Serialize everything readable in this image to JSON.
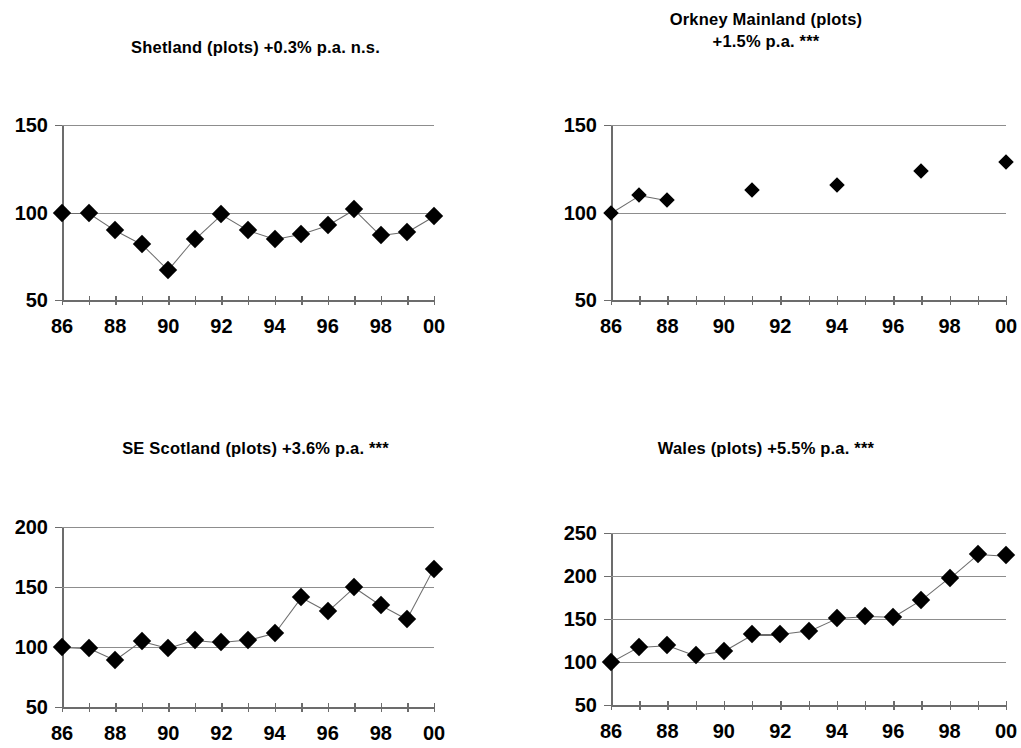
{
  "figure": {
    "panels": [
      {
        "id": "shetland",
        "title_lines": [
          "Shetland (plots) +0.3% p.a. n.s."
        ],
        "ylabels": [
          "150",
          "100",
          "50"
        ],
        "xlabels": [
          "86",
          "88",
          "90",
          "92",
          "94",
          "96",
          "98",
          "00"
        ],
        "marker_color": "#000000",
        "line_color": "#6b6b6b"
      },
      {
        "id": "orkney",
        "title_lines": [
          "Orkney Mainland (plots)",
          "+1.5% p.a. ***"
        ],
        "ylabels": [
          "150",
          "100",
          "50"
        ],
        "xlabels": [
          "86",
          "88",
          "90",
          "92",
          "94",
          "96",
          "98",
          "00"
        ],
        "marker_color": "#000000",
        "line_color": "#6b6b6b"
      },
      {
        "id": "se_scotland",
        "title_lines": [
          "SE Scotland (plots) +3.6% p.a. ***"
        ],
        "ylabels": [
          "200",
          "150",
          "100",
          "50"
        ],
        "xlabels": [
          "86",
          "88",
          "90",
          "92",
          "94",
          "96",
          "98",
          "00"
        ],
        "marker_color": "#000000",
        "line_color": "#6b6b6b"
      },
      {
        "id": "wales",
        "title_lines": [
          "Wales (plots) +5.5% p.a. ***"
        ],
        "ylabels": [
          "250",
          "200",
          "150",
          "100",
          "50"
        ],
        "xlabels": [
          "86",
          "88",
          "90",
          "92",
          "94",
          "96",
          "98",
          "00"
        ],
        "marker_color": "#000000",
        "line_color": "#6b6b6b"
      }
    ]
  },
  "chart_data": [
    {
      "type": "line",
      "title": "Shetland (plots) +0.3% p.a. n.s.",
      "xlabel": "",
      "ylabel": "",
      "x": [
        86,
        87,
        88,
        89,
        90,
        91,
        92,
        93,
        94,
        95,
        96,
        97,
        98,
        99,
        0
      ],
      "tick_labels": [
        "86",
        "87",
        "88",
        "89",
        "90",
        "91",
        "92",
        "93",
        "94",
        "95",
        "96",
        "97",
        "98",
        "99",
        "00"
      ],
      "xtick_labels_shown": [
        "86",
        "88",
        "90",
        "92",
        "94",
        "96",
        "98",
        "00"
      ],
      "values": [
        100,
        100,
        90,
        82,
        67,
        85,
        99,
        90,
        85,
        88,
        93,
        102,
        87,
        89,
        98
      ],
      "ylim": [
        50,
        150
      ],
      "yticks": [
        50,
        100,
        150
      ],
      "grid": true,
      "legend": "none",
      "annotation": "+0.3% p.a. n.s."
    },
    {
      "type": "scatter",
      "title": "Orkney Mainland (plots) +1.5% p.a. ***",
      "xlabel": "",
      "ylabel": "",
      "x": [
        86,
        87,
        88,
        91,
        94,
        97,
        0
      ],
      "tick_labels": [
        "86",
        "87",
        "88",
        "91",
        "94",
        "97",
        "00"
      ],
      "xtick_labels_shown": [
        "86",
        "88",
        "90",
        "92",
        "94",
        "96",
        "98",
        "00"
      ],
      "values": [
        100,
        110,
        107,
        113,
        116,
        124,
        129
      ],
      "ylim": [
        50,
        150
      ],
      "yticks": [
        50,
        100,
        150
      ],
      "grid": true,
      "legend": "none",
      "annotation": "+1.5% p.a. ***"
    },
    {
      "type": "line",
      "title": "SE Scotland (plots) +3.6% p.a. ***",
      "xlabel": "",
      "ylabel": "",
      "x": [
        86,
        87,
        88,
        89,
        90,
        91,
        92,
        93,
        94,
        95,
        96,
        97,
        98,
        99,
        0
      ],
      "tick_labels": [
        "86",
        "87",
        "88",
        "89",
        "90",
        "91",
        "92",
        "93",
        "94",
        "95",
        "96",
        "97",
        "98",
        "99",
        "00"
      ],
      "xtick_labels_shown": [
        "86",
        "88",
        "90",
        "92",
        "94",
        "96",
        "98",
        "00"
      ],
      "values": [
        100,
        99,
        89,
        105,
        99,
        106,
        104,
        106,
        112,
        142,
        130,
        150,
        135,
        123,
        165
      ],
      "ylim": [
        50,
        200
      ],
      "yticks": [
        50,
        100,
        150,
        200
      ],
      "grid": true,
      "legend": "none",
      "annotation": "+3.6% p.a. ***"
    },
    {
      "type": "line",
      "title": "Wales (plots) +5.5% p.a. ***",
      "xlabel": "",
      "ylabel": "",
      "x": [
        86,
        87,
        88,
        89,
        90,
        91,
        92,
        93,
        94,
        95,
        96,
        97,
        98,
        99,
        0
      ],
      "tick_labels": [
        "86",
        "87",
        "88",
        "89",
        "90",
        "91",
        "92",
        "93",
        "94",
        "95",
        "96",
        "97",
        "98",
        "99",
        "00"
      ],
      "xtick_labels_shown": [
        "86",
        "88",
        "90",
        "92",
        "94",
        "96",
        "98",
        "00"
      ],
      "values": [
        100,
        118,
        120,
        108,
        113,
        132,
        132,
        136,
        151,
        153,
        152,
        172,
        198,
        226,
        224
      ],
      "ylim": [
        50,
        250
      ],
      "yticks": [
        50,
        100,
        150,
        200,
        250
      ],
      "grid": true,
      "legend": "none",
      "annotation": "+5.5% p.a. ***"
    }
  ]
}
